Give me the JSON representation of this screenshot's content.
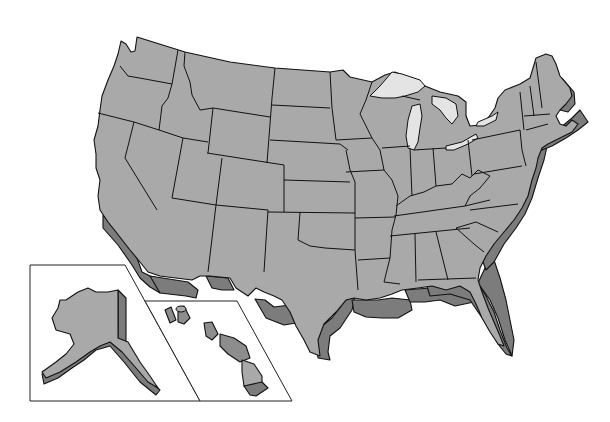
{
  "map": {
    "title": "",
    "subject": "United States (3D extruded outline map)",
    "regions": {
      "contiguous": [
        "Washington",
        "Oregon",
        "California",
        "Idaho",
        "Nevada",
        "Montana",
        "Wyoming",
        "Utah",
        "Arizona",
        "Colorado",
        "New Mexico",
        "North Dakota",
        "South Dakota",
        "Nebraska",
        "Kansas",
        "Oklahoma",
        "Texas",
        "Minnesota",
        "Iowa",
        "Missouri",
        "Arkansas",
        "Louisiana",
        "Wisconsin",
        "Illinois",
        "Michigan",
        "Indiana",
        "Ohio",
        "Kentucky",
        "Tennessee",
        "Mississippi",
        "Alabama",
        "Georgia",
        "Florida",
        "South Carolina",
        "North Carolina",
        "Virginia",
        "West Virginia",
        "Pennsylvania",
        "New York",
        "Vermont",
        "New Hampshire",
        "Maine",
        "Massachusetts",
        "Connecticut",
        "Rhode Island",
        "New Jersey",
        "Delaware",
        "Maryland"
      ],
      "insets": [
        "Alaska",
        "Hawaii"
      ]
    },
    "colors": {
      "land_top": "#a9a9a9",
      "extrusion_side": "#7c7c7c",
      "lakes": "#e4e4e4",
      "outline": "#111111",
      "background": "#ffffff"
    }
  }
}
